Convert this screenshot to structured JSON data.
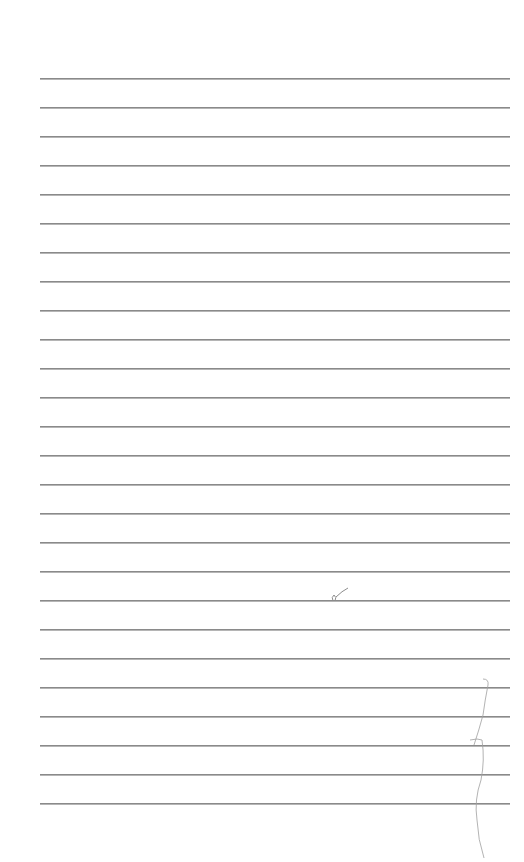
{
  "page": {
    "type": "lined-paper",
    "background": "#ffffff",
    "rule_color": "#8a8a8a",
    "rule_count": 26,
    "rule_left": 40,
    "rule_right": 510,
    "first_rule_y": 78,
    "rule_spacing": 29
  },
  "text": []
}
